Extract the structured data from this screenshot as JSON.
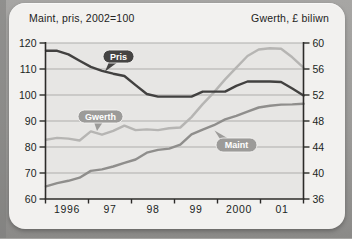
{
  "frame": {
    "outer_bg": "#9b9a98",
    "card_bg": "#f2f1ef",
    "plot_bg": "#e7e6e4",
    "gridline_color": "#aeadab",
    "axis_color": "#2c2b29",
    "text_color": "#201f1d"
  },
  "header": {
    "left_label": "Maint, pris, 2002=100",
    "right_label": "Gwerth, £ biliwn"
  },
  "chart_data": {
    "type": "line",
    "title": "",
    "x_label": "",
    "x_tick_labels": [
      "1996",
      "97",
      "98",
      "99",
      "2000",
      "01"
    ],
    "x_note": "quarterly points, 1996 Q1 - 2001 Q4",
    "left_axis": {
      "label": "Maint, pris, 2002=100",
      "min": 60,
      "max": 120,
      "ticks": [
        120,
        110,
        100,
        90,
        80,
        70,
        60
      ]
    },
    "right_axis": {
      "label": "Gwerth, £ biliwn",
      "min": 36,
      "max": 60,
      "ticks": [
        60,
        56,
        52,
        48,
        44,
        40,
        36
      ]
    },
    "grid": true,
    "series": [
      {
        "name": "Gwerth",
        "axis": "right",
        "color": "#b6b5b3",
        "label_bg": "#9c9b99",
        "label_text_color": "#ffffff",
        "values": [
          45.1,
          45.4,
          45.3,
          45.0,
          46.4,
          45.9,
          46.5,
          47.3,
          46.6,
          46.7,
          46.6,
          46.9,
          47.0,
          48.6,
          50.6,
          52.4,
          54.4,
          56.2,
          58.0,
          59.0,
          59.2,
          59.1,
          57.8,
          56.2
        ]
      },
      {
        "name": "Maint",
        "axis": "left",
        "color": "#8f8e8c",
        "label_bg": "#9c9b99",
        "label_text_color": "#ffffff",
        "values": [
          64.9,
          66.1,
          67.0,
          68.2,
          70.8,
          71.4,
          72.5,
          73.9,
          75.2,
          77.8,
          78.9,
          79.4,
          80.9,
          84.9,
          86.7,
          88.4,
          90.6,
          92.0,
          93.6,
          95.2,
          95.9,
          96.3,
          96.4,
          96.6
        ]
      },
      {
        "name": "Pris",
        "axis": "left",
        "color": "#424140",
        "label_bg": "#454443",
        "label_text_color": "#ffffff",
        "values": [
          117,
          117,
          115.6,
          113.2,
          110.8,
          109.3,
          108.2,
          107.3,
          103.8,
          100.4,
          99.4,
          99.4,
          99.4,
          99.4,
          101.3,
          101.3,
          101.3,
          103.5,
          105.2,
          105.2,
          105.2,
          105.0,
          102.5,
          99.8
        ]
      }
    ],
    "annotations": [
      {
        "series": "Pris",
        "text": "Pris"
      },
      {
        "series": "Gwerth",
        "text": "Gwerth"
      },
      {
        "series": "Maint",
        "text": "Maint"
      }
    ]
  }
}
